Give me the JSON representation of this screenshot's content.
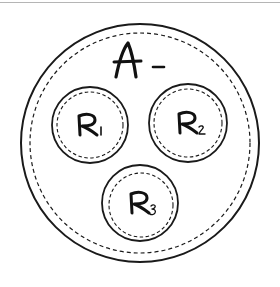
{
  "diagram": {
    "outer": {
      "label": "A",
      "suffix": "-",
      "cx": 140,
      "cy": 143,
      "r": 119,
      "inner_r": 110
    },
    "circles": [
      {
        "label": "R",
        "sub": "1",
        "cx": 90,
        "cy": 125,
        "r": 38,
        "inner_r": 33
      },
      {
        "label": "R",
        "sub": "2",
        "cx": 188,
        "cy": 123,
        "r": 39,
        "inner_r": 34
      },
      {
        "label": "R",
        "sub": "3",
        "cx": 140,
        "cy": 203,
        "r": 38,
        "inner_r": 33
      }
    ],
    "stroke_color": "#1a1a1a",
    "rule_color": "#b5b5b5"
  }
}
